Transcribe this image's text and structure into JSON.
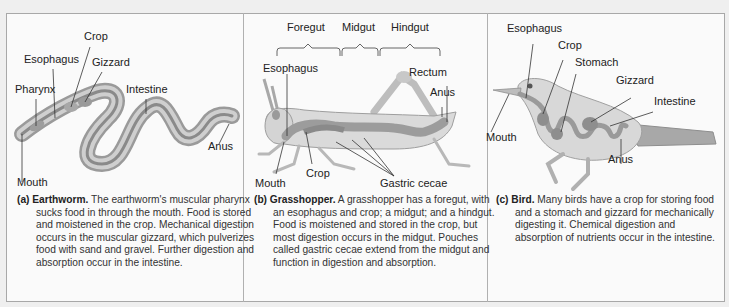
{
  "figure": {
    "panels": [
      {
        "id": "a",
        "tag": "(a)",
        "title": "Earthworm.",
        "caption": "The earthworm's muscular pharynx sucks food in through the mouth. Food is stored and moistened in the crop. Mechanical digestion occurs in the muscular gizzard, which pulverizes food with sand and gravel. Further digestion and absorption occur in the intestine.",
        "labels": {
          "crop": "Crop",
          "esophagus": "Esophagus",
          "gizzard": "Gizzard",
          "pharynx": "Pharynx",
          "intestine": "Intestine",
          "anus": "Anus",
          "mouth": "Mouth"
        }
      },
      {
        "id": "b",
        "tag": "(b)",
        "title": "Grasshopper.",
        "caption": "A grasshopper has a foregut, with an esophagus and crop; a midgut; and a hindgut. Food is moistened and stored in the crop, but most digestion occurs in the midgut. Pouches called gastric cecae extend from the midgut and function in digestion and absorption.",
        "labels": {
          "foregut": "Foregut",
          "midgut": "Midgut",
          "hindgut": "Hindgut",
          "esophagus": "Esophagus",
          "rectum": "Rectum",
          "anus": "Anus",
          "mouth": "Mouth",
          "crop": "Crop",
          "gastric_cecae": "Gastric cecae"
        }
      },
      {
        "id": "c",
        "tag": "(c)",
        "title": "Bird.",
        "caption": "Many birds have a crop for storing food and a stomach and gizzard for mechanically digesting it. Chemical digestion and absorption of nutrients occur in the intestine.",
        "labels": {
          "esophagus": "Esophagus",
          "crop": "Crop",
          "stomach": "Stomach",
          "gizzard": "Gizzard",
          "intestine": "Intestine",
          "mouth": "Mouth",
          "anus": "Anus"
        }
      }
    ],
    "colors": {
      "background": "#efefef",
      "panel_fill": "#fafafa",
      "border": "#a8a8a8",
      "organism_light": "#d8d8d8",
      "organism_mid": "#b4b4b4",
      "gut_dark": "#8e8e8e",
      "leader_line": "#333333"
    }
  }
}
